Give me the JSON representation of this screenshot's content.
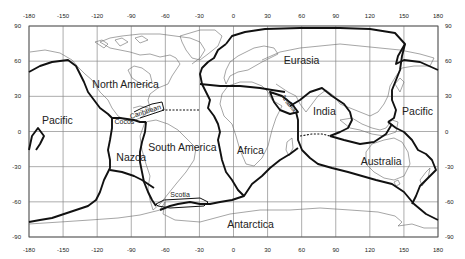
{
  "map": {
    "title": "",
    "projection": "equirectangular",
    "frame": {
      "left": 29,
      "right": 438,
      "top": 26,
      "bottom": 237
    },
    "x_ticks": [
      "-180",
      "-150",
      "-120",
      "-90",
      "-60",
      "-30",
      "0",
      "30",
      "60",
      "90",
      "120",
      "150",
      "180"
    ],
    "y_ticks_left": [
      "90",
      "60",
      "30",
      "0",
      "-30",
      "-60",
      "-90"
    ],
    "y_ticks_right": [
      "90",
      "60",
      "30",
      "0",
      "-30",
      "-60",
      "-90"
    ],
    "plates": [
      {
        "name": "North America",
        "lon": -95,
        "lat": 37
      },
      {
        "name": "Eurasia",
        "lon": 60,
        "lat": 58
      },
      {
        "name": "Pacific",
        "lon": -155,
        "lat": 6
      },
      {
        "name": "Pacific",
        "lon": 162,
        "lat": 14
      },
      {
        "name": "Cocos",
        "lon": -96,
        "lat": 6
      },
      {
        "name": "Caribbean",
        "lon": -77,
        "lat": 15
      },
      {
        "name": "Arabia",
        "lon": 47,
        "lat": 23
      },
      {
        "name": "India",
        "lon": 80,
        "lat": 14
      },
      {
        "name": "Nazca",
        "lon": -90,
        "lat": -25
      },
      {
        "name": "South America",
        "lon": -45,
        "lat": -17
      },
      {
        "name": "Africa",
        "lon": 15,
        "lat": -19
      },
      {
        "name": "Australia",
        "lon": 130,
        "lat": -29
      },
      {
        "name": "Scotia",
        "lon": -47,
        "lat": -56
      },
      {
        "name": "Antarctica",
        "lon": 15,
        "lat": -82
      }
    ],
    "colors": {
      "background": "#ffffff",
      "boundary": "#111111",
      "grid": "#8a8a8a",
      "coast": "#6a6a6a",
      "text": "#222222"
    }
  }
}
